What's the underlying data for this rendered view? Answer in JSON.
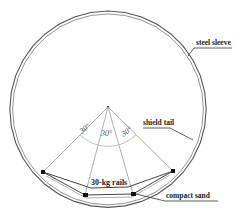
{
  "labels": {
    "steel_sleeve": "steel sleeve",
    "shield_tail": "shield tail",
    "rails": "30-kg rails",
    "compact_sand": "compact sand"
  },
  "angles": [
    "30°",
    "30°",
    "30°"
  ],
  "colors": {
    "outline": "#555555",
    "guide": "#aaaaaa",
    "support": "#111111"
  }
}
